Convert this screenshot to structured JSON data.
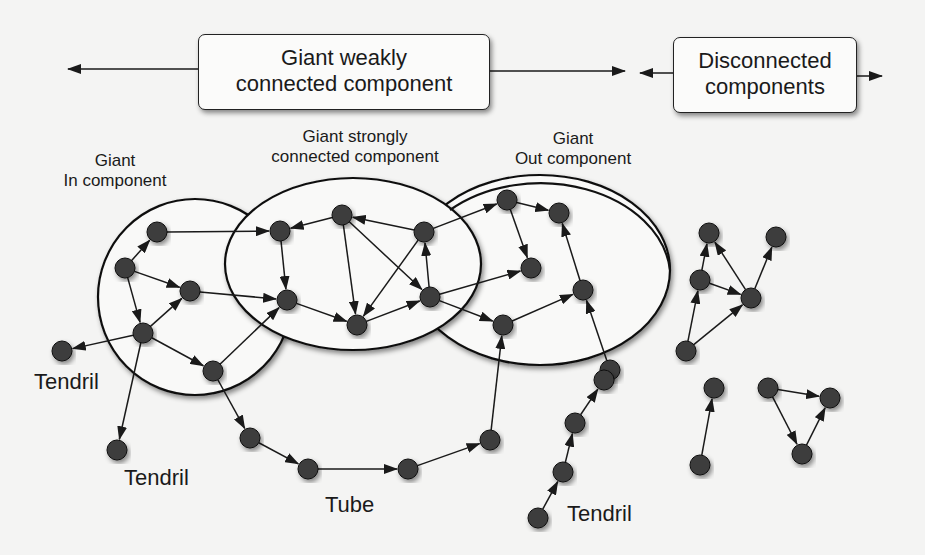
{
  "boxes": {
    "weak": {
      "line1": "Giant weakly",
      "line2": "connected component"
    },
    "disconnected": {
      "line1": "Disconnected",
      "line2": "components"
    }
  },
  "labels": {
    "in_component": {
      "line1": "Giant",
      "line2": "In component"
    },
    "scc": {
      "line1": "Giant strongly",
      "line2": "connected component"
    },
    "out_component": {
      "line1": "Giant",
      "line2": "Out component"
    },
    "tendril_left": "Tendril",
    "tendril_bottom": "Tendril",
    "tube": "Tube",
    "tendril_right": "Tendril"
  },
  "colors": {
    "node": "#3d3d3d",
    "edge": "#1a1a1a",
    "background": "#f4f4f3"
  },
  "graph": {
    "nodes": {
      "in1": [
        157,
        232
      ],
      "in2": [
        125,
        268
      ],
      "in3": [
        190,
        291
      ],
      "in4": [
        143,
        333
      ],
      "in5": [
        213,
        371
      ],
      "tl": [
        62,
        351
      ],
      "tb": [
        117,
        450
      ],
      "s1": [
        280,
        231
      ],
      "s2": [
        342,
        215
      ],
      "s3": [
        424,
        232
      ],
      "s4": [
        287,
        300
      ],
      "s5": [
        357,
        325
      ],
      "s6": [
        430,
        297
      ],
      "o1": [
        507,
        200
      ],
      "o2": [
        559,
        213
      ],
      "o3": [
        531,
        268
      ],
      "o4": [
        583,
        290
      ],
      "o5": [
        503,
        325
      ],
      "t1": [
        250,
        438
      ],
      "t2": [
        308,
        469
      ],
      "t3": [
        408,
        469
      ],
      "t4": [
        490,
        440
      ],
      "ot": [
        610,
        370
      ],
      "r1": [
        538,
        518
      ],
      "r2": [
        563,
        472
      ],
      "r3": [
        575,
        423
      ],
      "r4": [
        604,
        380
      ],
      "d1": [
        709,
        233
      ],
      "d2": [
        776,
        237
      ],
      "d3": [
        700,
        280
      ],
      "d4": [
        751,
        298
      ],
      "d5": [
        686,
        351
      ],
      "d6": [
        714,
        388
      ],
      "d7": [
        700,
        465
      ],
      "d8": [
        768,
        388
      ],
      "d9": [
        830,
        398
      ],
      "d10": [
        802,
        454
      ]
    },
    "edges": [
      [
        "in2",
        "in1"
      ],
      [
        "in2",
        "in3"
      ],
      [
        "in2",
        "in4"
      ],
      [
        "in4",
        "in3"
      ],
      [
        "in4",
        "tl"
      ],
      [
        "in4",
        "tb"
      ],
      [
        "in4",
        "in5"
      ],
      [
        "in1",
        "s1"
      ],
      [
        "in3",
        "s4"
      ],
      [
        "in5",
        "s4"
      ],
      [
        "in5",
        "t1"
      ],
      [
        "s2",
        "s1"
      ],
      [
        "s1",
        "s4"
      ],
      [
        "s2",
        "s5"
      ],
      [
        "s2",
        "s6"
      ],
      [
        "s3",
        "s2"
      ],
      [
        "s3",
        "s5"
      ],
      [
        "s6",
        "s3"
      ],
      [
        "s4",
        "s5"
      ],
      [
        "s5",
        "s6"
      ],
      [
        "s3",
        "o1"
      ],
      [
        "s6",
        "o3"
      ],
      [
        "s6",
        "o5"
      ],
      [
        "o1",
        "o2"
      ],
      [
        "o1",
        "o3"
      ],
      [
        "o5",
        "o4"
      ],
      [
        "o4",
        "o2"
      ],
      [
        "t1",
        "t2"
      ],
      [
        "t2",
        "t3"
      ],
      [
        "t3",
        "t4"
      ],
      [
        "t4",
        "o5"
      ],
      [
        "ot",
        "o4"
      ],
      [
        "r1",
        "r2"
      ],
      [
        "r2",
        "r3"
      ],
      [
        "r3",
        "r4"
      ],
      [
        "d3",
        "d1"
      ],
      [
        "d3",
        "d4"
      ],
      [
        "d4",
        "d1"
      ],
      [
        "d4",
        "d2"
      ],
      [
        "d5",
        "d3"
      ],
      [
        "d5",
        "d4"
      ],
      [
        "d7",
        "d6"
      ],
      [
        "d8",
        "d9"
      ],
      [
        "d8",
        "d10"
      ],
      [
        "d10",
        "d9"
      ]
    ]
  }
}
